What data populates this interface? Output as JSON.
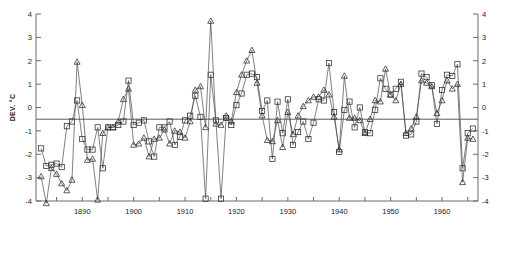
{
  "chart_data": {
    "type": "line",
    "title": "",
    "subtitle": "",
    "xlabel": "",
    "ylabel": "DEV. °C",
    "xlim": [
      1881,
      1967
    ],
    "ylim": [
      -4,
      4
    ],
    "yticks": [
      -4,
      -3,
      -2,
      -1,
      0,
      1,
      2,
      3,
      4
    ],
    "ytick_labels": [
      "-4",
      "-3",
      "-2",
      "-1",
      "0",
      "1",
      "2",
      "3",
      "4"
    ],
    "xticks": [
      1885,
      1890,
      1895,
      1900,
      1905,
      1910,
      1915,
      1920,
      1925,
      1930,
      1935,
      1940,
      1945,
      1950,
      1955,
      1960,
      1965
    ],
    "xtick_labels_shown": [
      "1890",
      "1900",
      "1910",
      "1920",
      "1930",
      "1940",
      "1950",
      "1960"
    ],
    "xtick_labeled_values": [
      1890,
      1900,
      1910,
      1920,
      1930,
      1940,
      1950,
      1960
    ],
    "grid": false,
    "legend": "none",
    "right_axis_mirrored": true,
    "annotations": [
      {
        "type": "hline",
        "y": -0.5,
        "label": "reference level -0.5 °C"
      }
    ],
    "x": [
      1882,
      1883,
      1884,
      1885,
      1886,
      1887,
      1888,
      1889,
      1890,
      1891,
      1892,
      1893,
      1894,
      1895,
      1896,
      1897,
      1898,
      1899,
      1900,
      1901,
      1902,
      1903,
      1904,
      1905,
      1906,
      1907,
      1908,
      1909,
      1910,
      1911,
      1912,
      1913,
      1914,
      1915,
      1916,
      1917,
      1918,
      1919,
      1920,
      1921,
      1922,
      1923,
      1924,
      1925,
      1926,
      1927,
      1928,
      1929,
      1930,
      1931,
      1932,
      1933,
      1934,
      1935,
      1936,
      1937,
      1938,
      1939,
      1940,
      1941,
      1942,
      1943,
      1944,
      1945,
      1946,
      1947,
      1948,
      1949,
      1950,
      1951,
      1952,
      1953,
      1954,
      1955,
      1956,
      1957,
      1958,
      1959,
      1960,
      1961,
      1962,
      1963,
      1964,
      1965,
      1966
    ],
    "series": [
      {
        "name": "series-squares",
        "marker": "square",
        "values": [
          -1.75,
          -2.5,
          -2.45,
          -2.4,
          -2.55,
          -0.8,
          -0.6,
          0.3,
          -1.35,
          -1.8,
          -1.8,
          -0.85,
          -2.6,
          -0.85,
          -0.85,
          -0.75,
          -0.6,
          1.15,
          -0.75,
          -0.65,
          -0.55,
          -1.45,
          -2.1,
          -0.85,
          -0.85,
          -0.6,
          -1.6,
          -1.25,
          -0.55,
          -0.35,
          0.5,
          -0.4,
          -3.9,
          1.4,
          -0.55,
          -3.9,
          -0.45,
          -0.75,
          0.1,
          0.6,
          1.4,
          1.45,
          1.3,
          -0.15,
          0.3,
          -2.2,
          0.25,
          -1.1,
          0.35,
          -1.6,
          -1.05,
          -0.6,
          -1.35,
          -0.65,
          0.35,
          0.3,
          1.9,
          -0.2,
          -1.9,
          -0.1,
          0.25,
          -0.85,
          0.0,
          -1.05,
          -1.1,
          -0.1,
          1.25,
          0.8,
          0.55,
          0.8,
          1.1,
          -1.2,
          -1.15,
          -0.6,
          1.45,
          1.3,
          0.95,
          -0.7,
          0.75,
          1.4,
          1.35,
          1.85,
          -2.6,
          -1.1,
          -0.9
        ]
      },
      {
        "name": "series-triangles",
        "marker": "triangle",
        "values": [
          -2.95,
          -4.1,
          -2.6,
          -2.85,
          -3.25,
          -3.55,
          -3.1,
          1.95,
          0.1,
          -2.25,
          -2.2,
          -3.95,
          -1.1,
          -0.85,
          -0.85,
          -0.6,
          0.35,
          0.8,
          -1.6,
          -1.55,
          -1.3,
          -2.1,
          -1.35,
          -1.3,
          -0.95,
          -1.55,
          -1.0,
          -1.05,
          -1.3,
          -0.6,
          0.75,
          0.9,
          -0.85,
          3.7,
          -0.7,
          -0.75,
          -0.35,
          -0.6,
          0.65,
          1.4,
          2.0,
          2.45,
          1.05,
          -0.35,
          -1.4,
          -1.45,
          -0.55,
          -1.7,
          -0.2,
          -1.15,
          -0.35,
          0.05,
          0.3,
          0.45,
          0.45,
          0.75,
          0.55,
          -0.4,
          -1.8,
          1.35,
          -0.45,
          -0.45,
          -0.55,
          -1.1,
          -0.5,
          0.3,
          0.25,
          1.65,
          0.55,
          0.3,
          1.0,
          -1.1,
          -0.9,
          -0.4,
          1.15,
          1.05,
          0.9,
          -0.25,
          0.3,
          1.15,
          0.8,
          1.0,
          -3.2,
          -1.3,
          -1.35
        ]
      }
    ]
  },
  "axis": {
    "left_label": "DEV. °C"
  }
}
